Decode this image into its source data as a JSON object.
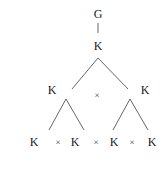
{
  "diagram": {
    "type": "tree",
    "nodes": [
      {
        "id": "root",
        "label": "G",
        "x": 98,
        "y": 18
      },
      {
        "id": "k0",
        "label": "K",
        "x": 98,
        "y": 50
      },
      {
        "id": "k1",
        "label": "K",
        "x": 52,
        "y": 94
      },
      {
        "id": "k2",
        "label": "K",
        "x": 145,
        "y": 94
      },
      {
        "id": "k11",
        "label": "K",
        "x": 34,
        "y": 146
      },
      {
        "id": "k12",
        "label": "K",
        "x": 75,
        "y": 146
      },
      {
        "id": "k21",
        "label": "K",
        "x": 114,
        "y": 146
      },
      {
        "id": "k22",
        "label": "K",
        "x": 152,
        "y": 146
      }
    ],
    "operators": [
      {
        "id": "op-level1",
        "label": "×",
        "x": 97,
        "y": 98
      },
      {
        "id": "op-left",
        "label": "×",
        "x": 58,
        "y": 145
      },
      {
        "id": "op-middle",
        "label": "×",
        "x": 96,
        "y": 145
      },
      {
        "id": "op-right",
        "label": "×",
        "x": 132,
        "y": 145
      }
    ],
    "edges": [
      {
        "from": "root",
        "to": "k0",
        "x1": 98,
        "y1": 23,
        "x2": 98,
        "y2": 33
      },
      {
        "from": "k0",
        "to": "k1",
        "x1": 98,
        "y1": 58,
        "x2": 72,
        "y2": 89
      },
      {
        "from": "k0",
        "to": "k2",
        "x1": 98,
        "y1": 58,
        "x2": 128,
        "y2": 89
      },
      {
        "from": "k1",
        "to": "k11",
        "x1": 66,
        "y1": 99,
        "x2": 49,
        "y2": 130
      },
      {
        "from": "k1",
        "to": "k12",
        "x1": 66,
        "y1": 99,
        "x2": 84,
        "y2": 130
      },
      {
        "from": "k2",
        "to": "k21",
        "x1": 130,
        "y1": 99,
        "x2": 113,
        "y2": 130
      },
      {
        "from": "k2",
        "to": "k22",
        "x1": 130,
        "y1": 99,
        "x2": 148,
        "y2": 130
      }
    ]
  }
}
